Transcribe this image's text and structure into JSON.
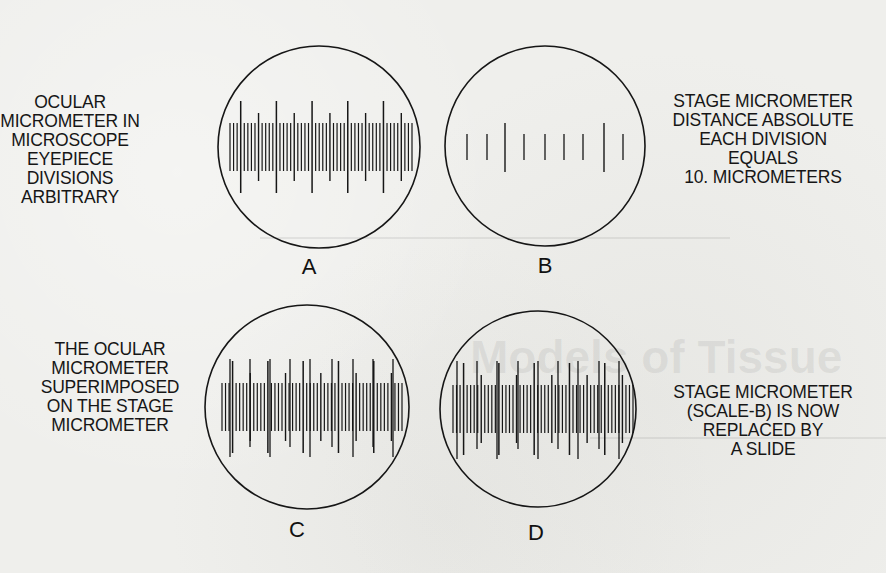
{
  "figure": {
    "panels": [
      {
        "id": "A",
        "letter": "A",
        "caption_lines": [
          "OCULAR",
          "MICROMETER IN",
          "MICROSCOPE",
          "EYEPIECE",
          "DIVISIONS",
          "ARBITRARY"
        ],
        "caption_side": "left",
        "scale_type": "ocular",
        "ocular_divisions": 50,
        "long_tick_every": 10,
        "medium_tick_every": 5
      },
      {
        "id": "B",
        "letter": "B",
        "caption_lines": [
          "STAGE MICROMETER",
          "DISTANCE ABSOLUTE",
          "EACH DIVISION",
          "EQUALS",
          "10. MICROMETERS"
        ],
        "caption_side": "right",
        "scale_type": "stage",
        "stage_ticks": [
          "short",
          "short",
          "long",
          "short",
          "short",
          "short",
          "short",
          "long",
          "short"
        ]
      },
      {
        "id": "C",
        "letter": "C",
        "caption_lines": [
          "THE OCULAR",
          "MICROMETER",
          "SUPERIMPOSED",
          "ON THE STAGE",
          "MICROMETER"
        ],
        "caption_side": "left",
        "scale_type": "superimposed",
        "ocular_divisions": 50
      },
      {
        "id": "D",
        "letter": "D",
        "caption_lines": [
          "STAGE MICROMETER",
          "(SCALE-B) IS NOW",
          "REPLACED BY",
          "A SLIDE"
        ],
        "caption_side": "right",
        "scale_type": "ocular_on_slide",
        "ocular_divisions": 50
      }
    ],
    "colors": {
      "ink": "#161616",
      "paper": "#efefec"
    }
  },
  "bleed_through": {
    "title_fragment": "Models of Tissue",
    "heading_fragment": "STRUCTURE",
    "body_fragment": "The plasma membrane is a trilaminar or three-layered membrane of lipid and protein"
  }
}
